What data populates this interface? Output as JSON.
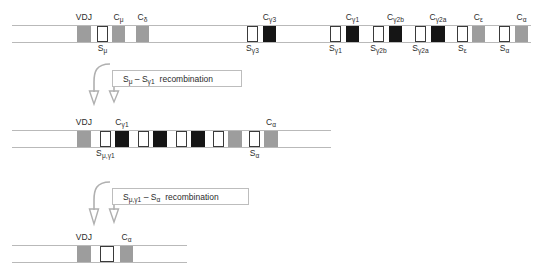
{
  "figure": {
    "colors": {
      "gray_segment": "#9d9d9d",
      "black_segment": "#151515",
      "white_segment": "#ffffff",
      "outline": "#3a3a3a",
      "chromosome_line": "#b9b9b9",
      "arrow": "#b0b0b0",
      "text": "#2b2b2b"
    }
  },
  "rows": [
    {
      "id": "germline",
      "name": "germline-locus",
      "segments": [
        {
          "name": "vdj",
          "label": "VDJ",
          "sublabel": "",
          "fill": "gray",
          "x": 77,
          "w": 14
        },
        {
          "name": "s-mu",
          "label": "",
          "sublabel": "S<sub>μ</sub>",
          "fill": "white",
          "x": 97,
          "w": 11
        },
        {
          "name": "c-mu",
          "label": "C<sub>μ</sub>",
          "sublabel": "",
          "fill": "gray",
          "x": 112,
          "w": 13
        },
        {
          "name": "c-delta",
          "label": "C<sub>δ</sub>",
          "sublabel": "",
          "fill": "gray",
          "x": 136,
          "w": 13
        },
        {
          "name": "s-gamma3",
          "label": "",
          "sublabel": "S<sub>γ3</sub>",
          "fill": "white",
          "x": 247,
          "w": 11
        },
        {
          "name": "c-gamma3",
          "label": "C<sub>γ3</sub>",
          "sublabel": "",
          "fill": "black",
          "x": 263,
          "w": 13
        },
        {
          "name": "s-gamma1",
          "label": "",
          "sublabel": "S<sub>γ1</sub>",
          "fill": "white",
          "x": 330,
          "w": 11
        },
        {
          "name": "c-gamma1",
          "label": "C<sub>γ1</sub>",
          "sublabel": "",
          "fill": "black",
          "x": 346,
          "w": 13
        },
        {
          "name": "s-gamma2b",
          "label": "",
          "sublabel": "S<sub>γ2b</sub>",
          "fill": "white",
          "x": 373,
          "w": 11
        },
        {
          "name": "c-gamma2b",
          "label": "C<sub>γ2b</sub>",
          "sublabel": "",
          "fill": "black",
          "x": 389,
          "w": 13
        },
        {
          "name": "s-gamma2a",
          "label": "",
          "sublabel": "S<sub>γ2a</sub>",
          "fill": "white",
          "x": 415,
          "w": 11
        },
        {
          "name": "c-gamma2a",
          "label": "C<sub>γ2a</sub>",
          "sublabel": "",
          "fill": "black",
          "x": 431,
          "w": 14
        },
        {
          "name": "s-epsilon",
          "label": "",
          "sublabel": "S<sub>ε</sub>",
          "fill": "white",
          "x": 457,
          "w": 11
        },
        {
          "name": "c-epsilon",
          "label": "C<sub>ε</sub>",
          "sublabel": "",
          "fill": "gray",
          "x": 472,
          "w": 13
        },
        {
          "name": "s-alpha",
          "label": "",
          "sublabel": "S<sub>α</sub>",
          "fill": "white",
          "x": 499,
          "w": 11
        },
        {
          "name": "c-alpha",
          "label": "C<sub>α</sub>",
          "sublabel": "",
          "fill": "gray",
          "x": 515,
          "w": 13
        }
      ]
    },
    {
      "id": "post-switch-1",
      "name": "post-first-recombination-locus",
      "segments": [
        {
          "name": "vdj",
          "label": "VDJ",
          "sublabel": "",
          "fill": "gray",
          "x": 77,
          "w": 14
        },
        {
          "name": "s-mu-gamma1",
          "label": "",
          "sublabel": "S<sub>μ,γ1</sub>",
          "fill": "white",
          "x": 100,
          "w": 11
        },
        {
          "name": "c-gamma1",
          "label": "C<sub>γ1</sub>",
          "sublabel": "",
          "fill": "black",
          "x": 115,
          "w": 14
        },
        {
          "name": "s-gamma2b",
          "label": "",
          "sublabel": "",
          "fill": "white",
          "x": 138,
          "w": 11
        },
        {
          "name": "c-gamma2b",
          "label": "",
          "sublabel": "",
          "fill": "black",
          "x": 153,
          "w": 14
        },
        {
          "name": "s-gamma2a",
          "label": "",
          "sublabel": "",
          "fill": "white",
          "x": 176,
          "w": 11
        },
        {
          "name": "c-gamma2a",
          "label": "",
          "sublabel": "",
          "fill": "black",
          "x": 191,
          "w": 14
        },
        {
          "name": "s-epsilon",
          "label": "",
          "sublabel": "",
          "fill": "white",
          "x": 213,
          "w": 11
        },
        {
          "name": "c-epsilon",
          "label": "",
          "sublabel": "",
          "fill": "gray",
          "x": 228,
          "w": 14
        },
        {
          "name": "s-alpha",
          "label": "",
          "sublabel": "S<sub>α</sub>",
          "fill": "white",
          "x": 249,
          "w": 11
        },
        {
          "name": "c-alpha",
          "label": "C<sub>α</sub>",
          "sublabel": "",
          "fill": "gray",
          "x": 264,
          "w": 14
        }
      ]
    },
    {
      "id": "post-switch-2",
      "name": "post-second-recombination-locus",
      "segments": [
        {
          "name": "vdj",
          "label": "VDJ",
          "sublabel": "",
          "fill": "gray",
          "x": 77,
          "w": 14
        },
        {
          "name": "s-mu-gamma1-alpha",
          "label": "",
          "sublabel": "",
          "fill": "white",
          "x": 100,
          "w": 14
        },
        {
          "name": "c-alpha",
          "label": "C<sub>α</sub>",
          "sublabel": "",
          "fill": "gray",
          "x": 120,
          "w": 13
        }
      ]
    }
  ],
  "recombinations": [
    {
      "name": "first-recombination",
      "text": "S<sub>μ</sub> – S<sub>γ1</sub><span class=\"sp\"></span>recombination",
      "plain": "Sμ – Sγ1 recombination"
    },
    {
      "name": "second-recombination",
      "text": "S<sub>μ,γ1</sub> – S<sub>α</sub><span class=\"sp\"></span>recombination",
      "plain": "Sμ,γ1 – Sα recombination"
    }
  ]
}
